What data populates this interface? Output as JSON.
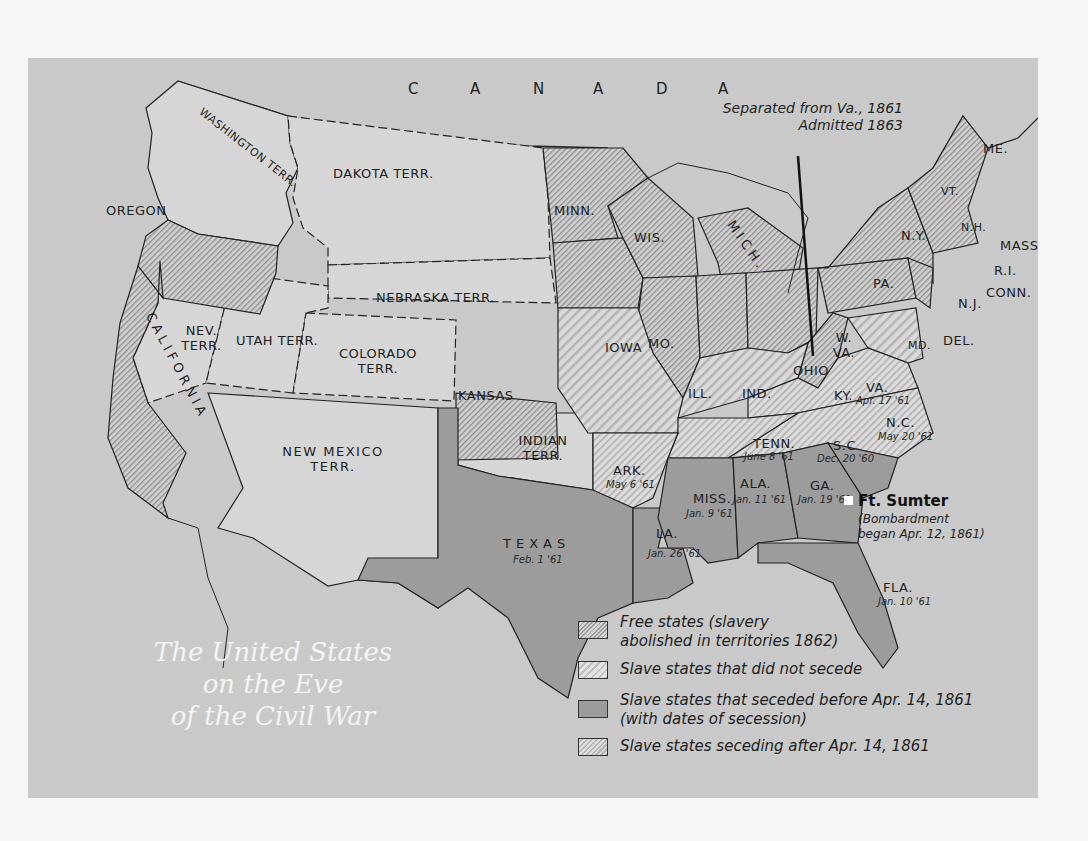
{
  "map": {
    "title_lines": [
      "The United States",
      "on the Eve",
      "of the Civil War"
    ],
    "country_label": [
      "C",
      "A",
      "N",
      "A",
      "D",
      "A"
    ],
    "annotation": {
      "lines": [
        "Separated from Va., 1861",
        "Admitted 1863"
      ],
      "refers_to": "W. VA."
    },
    "fort_sumter": {
      "label": "Ft. Sumter",
      "note_lines": [
        "(Bombardment",
        "began Apr. 12, 1861)"
      ]
    },
    "colors": {
      "panel_bg": "#c9c9c9",
      "territory_fill": "#d6d6d6",
      "seceded_fill": "#9c9c9c",
      "title_text": "#f4f4f4",
      "page_bg": "#f6f6f6"
    },
    "legend": [
      {
        "category": "free",
        "lines": [
          "Free states (slavery",
          "abolished in territories 1862)"
        ]
      },
      {
        "category": "border",
        "lines": [
          "Slave states that did not secede"
        ]
      },
      {
        "category": "seceded_before",
        "lines": [
          "Slave states that seceded before Apr. 14, 1861",
          "(with dates of secession)"
        ]
      },
      {
        "category": "seceded_after",
        "lines": [
          "Slave states seceding after Apr. 14, 1861"
        ]
      }
    ],
    "regions": {
      "free": [
        {
          "label": "OREGON"
        },
        {
          "label": "CALIFORNIA"
        },
        {
          "label": "MINN."
        },
        {
          "label": "WIS."
        },
        {
          "label": "MICH."
        },
        {
          "label": "IOWA"
        },
        {
          "label": "ILL."
        },
        {
          "label": "IND."
        },
        {
          "label": "OHIO"
        },
        {
          "label": "KANSAS"
        },
        {
          "label": "PA."
        },
        {
          "label": "N.Y."
        },
        {
          "label": "N.J."
        },
        {
          "label": "VT."
        },
        {
          "label": "N.H."
        },
        {
          "label": "ME."
        },
        {
          "label": "MASS."
        },
        {
          "label": "R.I."
        },
        {
          "label": "CONN."
        },
        {
          "label": "W. VA."
        }
      ],
      "border": [
        {
          "label": "MO."
        },
        {
          "label": "KY."
        },
        {
          "label": "MD."
        },
        {
          "label": "DEL."
        }
      ],
      "seceded_before": [
        {
          "label": "S.C.",
          "date": "Dec. 20 '60"
        },
        {
          "label": "MISS.",
          "date": "Jan. 9 '61"
        },
        {
          "label": "FLA.",
          "date": "Jan. 10 '61"
        },
        {
          "label": "ALA.",
          "date": "Jan. 11 '61"
        },
        {
          "label": "GA.",
          "date": "Jan. 19 '61"
        },
        {
          "label": "LA.",
          "date": "Jan. 26 '61"
        },
        {
          "label": "TEXAS",
          "date": "Feb. 1 '61"
        }
      ],
      "seceded_after": [
        {
          "label": "VA.",
          "date": "Apr. 17 '61"
        },
        {
          "label": "ARK.",
          "date": "May 6 '61"
        },
        {
          "label": "N.C.",
          "date": "May 20 '61"
        },
        {
          "label": "TENN.",
          "date": "June 8 '61"
        }
      ],
      "territories": [
        {
          "label": "WASHINGTON TERR."
        },
        {
          "label": "DAKOTA TERR."
        },
        {
          "label": "NEBRASKA TERR."
        },
        {
          "label": "NEV. TERR."
        },
        {
          "label": "UTAH TERR."
        },
        {
          "label": "COLORADO TERR."
        },
        {
          "label": "NEW MEXICO TERR."
        },
        {
          "label": "INDIAN TERR."
        }
      ]
    }
  }
}
